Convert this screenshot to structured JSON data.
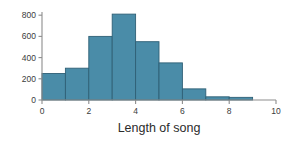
{
  "chart_data": {
    "type": "bar",
    "title": "",
    "subtitle": "",
    "xlabel": "Length of song",
    "ylabel": "",
    "categories": [
      "0-1",
      "1-2",
      "2-3",
      "3-4",
      "4-5",
      "5-6",
      "6-7",
      "7-8",
      "8-9"
    ],
    "bin_edges": [
      0,
      1,
      2,
      3,
      4,
      5,
      6,
      7,
      8,
      9
    ],
    "values": [
      250,
      300,
      600,
      810,
      550,
      350,
      105,
      30,
      25
    ],
    "xlim": [
      0,
      10
    ],
    "ylim": [
      0,
      830
    ],
    "xticks": [
      0,
      2,
      4,
      6,
      8,
      10
    ],
    "yticks": [
      0,
      200,
      400,
      600,
      800
    ],
    "xtick_labels": [
      "0",
      "2",
      "4",
      "6",
      "8",
      "10"
    ],
    "ytick_labels": [
      "0",
      "200",
      "400",
      "600",
      "800"
    ],
    "grid": false,
    "legend": null,
    "legend_position": "none",
    "bar_fill_color": "#4a8ca8",
    "bar_edge_color": "#2f6076",
    "axis_color": "#8d8d8d",
    "background_color": "#ffffff",
    "annotations": []
  }
}
